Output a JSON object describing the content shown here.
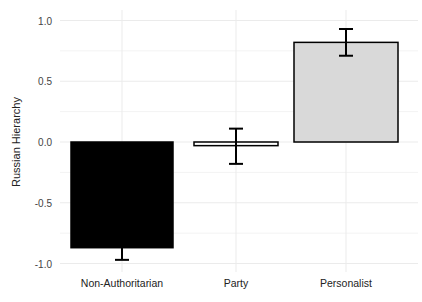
{
  "chart_data": {
    "type": "bar",
    "title": "",
    "xlabel": "",
    "ylabel": "Russian Hierarchy",
    "categories": [
      "Non-Authoritarian",
      "Party",
      "Personalist"
    ],
    "values": [
      -0.87,
      -0.03,
      0.82
    ],
    "error_low": [
      -0.97,
      -0.18,
      0.71
    ],
    "error_high": [
      -0.77,
      0.11,
      0.93
    ],
    "fill_colors": [
      "#000000",
      "#ffffff",
      "#d9d9d9"
    ],
    "ylim": [
      -1.05,
      1.05
    ],
    "yticks": [
      1.0,
      0.5,
      0.0,
      -0.5,
      -1.0
    ],
    "ytick_labels": [
      "1.0",
      "0.5",
      "0.0",
      "-0.5",
      "-1.0"
    ],
    "grid": true,
    "legend": null
  }
}
